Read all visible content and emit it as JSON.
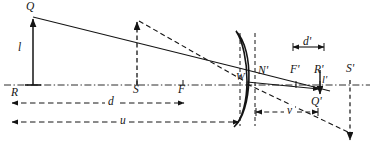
{
  "diagram": {
    "type": "optics-ray-diagram",
    "ink_color": "#141414",
    "canvas": {
      "width": 374,
      "height": 149
    },
    "labels": [
      {
        "key": "Q",
        "text": "Q",
        "x": 26,
        "y": 3,
        "size": "md",
        "role": "object-point"
      },
      {
        "key": "l",
        "text": "l",
        "x": 18,
        "y": 44,
        "size": "md",
        "role": "object-height"
      },
      {
        "key": "R",
        "text": "R",
        "x": 11,
        "y": 89,
        "size": "md",
        "role": "axis-point-R"
      },
      {
        "key": "S",
        "text": "S",
        "x": 133,
        "y": 86,
        "size": "md",
        "role": "axis-point-S"
      },
      {
        "key": "F",
        "text": "F",
        "x": 177,
        "y": 86,
        "size": "md",
        "role": "focal-point-F"
      },
      {
        "key": "d",
        "text": "d",
        "x": 105,
        "y": 99,
        "size": "md",
        "role": "distance-d"
      },
      {
        "key": "u",
        "text": "u",
        "x": 117,
        "y": 119,
        "size": "md",
        "role": "object-distance-u"
      },
      {
        "key": "W",
        "text": "W",
        "x": 237,
        "y": 71,
        "size": "sm",
        "role": "principal-point-W"
      },
      {
        "key": "Nprime",
        "text": "N'",
        "x": 257,
        "y": 66,
        "size": "md",
        "role": "nodal-point-N-prime"
      },
      {
        "key": "dprime",
        "text": "d'",
        "x": 305,
        "y": 40,
        "size": "md",
        "role": "distance-d-prime"
      },
      {
        "key": "Fprime",
        "text": "F'",
        "x": 292,
        "y": 64,
        "size": "md",
        "role": "focal-point-F-prime"
      },
      {
        "key": "Rprime",
        "text": "R'",
        "x": 314,
        "y": 64,
        "size": "md",
        "role": "axis-point-R-prime"
      },
      {
        "key": "Sprime",
        "text": "S'",
        "x": 347,
        "y": 64,
        "size": "md",
        "role": "axis-point-S-prime"
      },
      {
        "key": "lprime",
        "text": "l'",
        "x": 318,
        "y": 78,
        "size": "sm",
        "role": "image-height-l-prime"
      },
      {
        "key": "Qprime",
        "text": "Q'",
        "x": 313,
        "y": 99,
        "size": "md",
        "role": "image-point-Q-prime"
      },
      {
        "key": "v",
        "text": "v",
        "x": 285,
        "y": 108,
        "size": "md",
        "role": "image-distance-v"
      }
    ],
    "geometry": {
      "optical_axis": {
        "y": 85,
        "x1": 4,
        "x2": 370,
        "style": "dash-dot"
      },
      "object_arrow": {
        "x": 33,
        "y_base": 85,
        "y_tip": 17,
        "style": "solid",
        "arrow": "up"
      },
      "secondary_object_arrow": {
        "x": 137,
        "y_base": 85,
        "y_tip": 20,
        "style": "dashed",
        "arrow": "up"
      },
      "image_arrow": {
        "x": 320,
        "y_base": 68,
        "y_tip": 92,
        "style": "solid",
        "arrow": "down"
      },
      "lens": {
        "vertex_x": 240,
        "top_y": 30,
        "bottom_y": 126,
        "shape": "meniscus"
      },
      "rays": [
        {
          "name": "chief-ray-solid",
          "style": "solid",
          "points": "33,17 325,90"
        },
        {
          "name": "upper-ray-dashed",
          "style": "dashed",
          "points": "137,20 245,83"
        },
        {
          "name": "exit-ray-solid",
          "style": "solid",
          "points": "245,83 320,90"
        },
        {
          "name": "lower-ray-dashed",
          "style": "dashed",
          "points": "245,86 352,136"
        }
      ],
      "verticals": [
        {
          "name": "lens-left-vertical",
          "x": 240,
          "y1": 33,
          "y2": 126,
          "style": "dashed"
        },
        {
          "name": "lens-right-vertical",
          "x": 255,
          "y1": 33,
          "y2": 126,
          "style": "dashed"
        },
        {
          "name": "s-prime-vertical",
          "x": 350,
          "y1": 85,
          "y2": 138,
          "style": "dashed",
          "arrow": "down"
        }
      ],
      "dimension_lines": [
        {
          "name": "d-dimension",
          "y": 103,
          "x1": 11,
          "x2": 185,
          "style": "dashed",
          "arrows": "both"
        },
        {
          "name": "u-dimension",
          "y": 122,
          "x1": 11,
          "x2": 240,
          "style": "dashed",
          "arrows": "both"
        },
        {
          "name": "v-dimension",
          "y": 112,
          "x1": 255,
          "x2": 320,
          "style": "dashed",
          "arrows": "both"
        },
        {
          "name": "dprime-dimension",
          "y": 47,
          "x1": 292,
          "x2": 325,
          "style": "solid",
          "arrows": "both"
        }
      ]
    }
  }
}
